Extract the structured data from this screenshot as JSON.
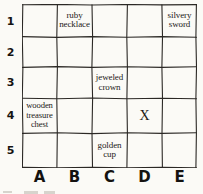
{
  "map": {
    "columns": [
      "A",
      "B",
      "C",
      "D",
      "E"
    ],
    "rows": [
      "1",
      "2",
      "3",
      "4",
      "5"
    ],
    "ink_color": "#2b2825",
    "paper_color": "#fbfaf6",
    "cells": [
      {
        "id": "A1",
        "col": 0,
        "row": 0,
        "label": ""
      },
      {
        "id": "B1",
        "col": 1,
        "row": 0,
        "label": "ruby necklace"
      },
      {
        "id": "C1",
        "col": 2,
        "row": 0,
        "label": ""
      },
      {
        "id": "D1",
        "col": 3,
        "row": 0,
        "label": ""
      },
      {
        "id": "E1",
        "col": 4,
        "row": 0,
        "label": "silvery sword"
      },
      {
        "id": "A2",
        "col": 0,
        "row": 1,
        "label": ""
      },
      {
        "id": "B2",
        "col": 1,
        "row": 1,
        "label": ""
      },
      {
        "id": "C2",
        "col": 2,
        "row": 1,
        "label": ""
      },
      {
        "id": "D2",
        "col": 3,
        "row": 1,
        "label": ""
      },
      {
        "id": "E2",
        "col": 4,
        "row": 1,
        "label": ""
      },
      {
        "id": "A3",
        "col": 0,
        "row": 2,
        "label": ""
      },
      {
        "id": "B3",
        "col": 1,
        "row": 2,
        "label": ""
      },
      {
        "id": "C3",
        "col": 2,
        "row": 2,
        "label": "jeweled crown"
      },
      {
        "id": "D3",
        "col": 3,
        "row": 2,
        "label": ""
      },
      {
        "id": "E3",
        "col": 4,
        "row": 2,
        "label": ""
      },
      {
        "id": "A4",
        "col": 0,
        "row": 3,
        "label": "wooden treasure chest"
      },
      {
        "id": "B4",
        "col": 1,
        "row": 3,
        "label": ""
      },
      {
        "id": "C4",
        "col": 2,
        "row": 3,
        "label": ""
      },
      {
        "id": "D4",
        "col": 3,
        "row": 3,
        "label": "X"
      },
      {
        "id": "E4",
        "col": 4,
        "row": 3,
        "label": ""
      },
      {
        "id": "A5",
        "col": 0,
        "row": 4,
        "label": ""
      },
      {
        "id": "B5",
        "col": 1,
        "row": 4,
        "label": ""
      },
      {
        "id": "C5",
        "col": 2,
        "row": 4,
        "label": "golden cup"
      },
      {
        "id": "D5",
        "col": 3,
        "row": 4,
        "label": ""
      },
      {
        "id": "E5",
        "col": 4,
        "row": 4,
        "label": ""
      }
    ]
  }
}
